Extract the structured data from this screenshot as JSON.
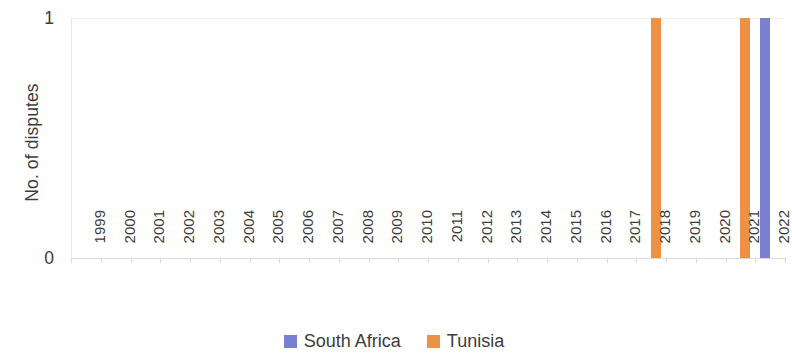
{
  "chart_data": {
    "type": "bar",
    "title": "",
    "xlabel": "",
    "ylabel": "No. of disputes",
    "categories": [
      "1999",
      "2000",
      "2001",
      "2002",
      "2003",
      "2004",
      "2005",
      "2006",
      "2007",
      "2008",
      "2009",
      "2010",
      "2011",
      "2012",
      "2013",
      "2014",
      "2015",
      "2016",
      "2017",
      "2018",
      "2019",
      "2020",
      "2021",
      "2022"
    ],
    "series": [
      {
        "name": "South Africa",
        "color": "#7b7fd0",
        "values": [
          0,
          0,
          0,
          0,
          0,
          0,
          0,
          0,
          0,
          0,
          0,
          0,
          0,
          0,
          0,
          0,
          0,
          0,
          0,
          0,
          0,
          0,
          0,
          1
        ]
      },
      {
        "name": "Tunisia",
        "color": "#ed9242",
        "values": [
          0,
          0,
          0,
          0,
          0,
          0,
          0,
          0,
          0,
          0,
          0,
          0,
          0,
          0,
          0,
          0,
          0,
          0,
          0,
          1,
          0,
          0,
          1,
          0
        ]
      }
    ],
    "ylim": [
      0,
      1
    ],
    "y_ticks": [
      "0",
      "1"
    ],
    "grid": true,
    "legend_position": "bottom"
  },
  "axis": {
    "y_title": "No. of disputes",
    "y_tick_max": "1",
    "y_tick_min": "0"
  },
  "legend": {
    "items": [
      {
        "label": "South Africa",
        "color": "#7b7fd0"
      },
      {
        "label": "Tunisia",
        "color": "#ed9242"
      }
    ]
  }
}
